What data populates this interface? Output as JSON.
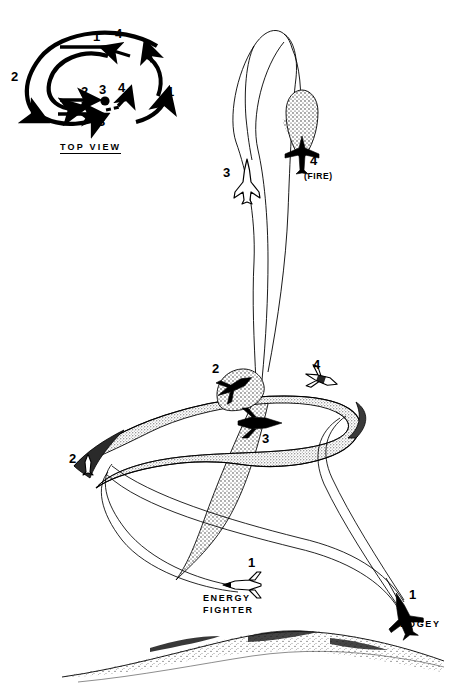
{
  "figure": {
    "title_visible": false,
    "background_color": "#ffffff",
    "ink_color": "#000000",
    "style": "black-and-white line art with stipple shading"
  },
  "top_view": {
    "label": "TOP VIEW",
    "description": "Overhead plan view of the two-circle fight showing four numbered positions for each aircraft",
    "merge_point_marker": "filled dot",
    "markers": [
      {
        "id": "tv-1-left",
        "text": "1",
        "x": 96,
        "y": 36,
        "meaning": "energy fighter position 1"
      },
      {
        "id": "tv-4-left",
        "text": "4",
        "x": 118,
        "y": 33,
        "meaning": "bogey position 4"
      },
      {
        "id": "tv-2-left",
        "text": "2",
        "x": 14,
        "y": 76,
        "meaning": "energy fighter position 2"
      },
      {
        "id": "tv-1-right",
        "text": "1",
        "x": 169,
        "y": 91,
        "meaning": "bogey position 1"
      },
      {
        "id": "tv-2-inner",
        "text": "2",
        "x": 84,
        "y": 90,
        "meaning": "bogey position 2"
      },
      {
        "id": "tv-3-inner",
        "text": "3",
        "x": 101,
        "y": 88,
        "meaning": "merge point 3"
      },
      {
        "id": "tv-4-inner",
        "text": "4",
        "x": 119,
        "y": 86,
        "meaning": "energy fighter position 4"
      },
      {
        "id": "tv-3-lower",
        "text": "3",
        "x": 100,
        "y": 119,
        "meaning": "bogey position 3"
      }
    ]
  },
  "side_view": {
    "description": "Perspective side view of a vertical rolling scissors: the dark bogey flies a wide banked ribbon trail while the outlined energy fighter flies thin-line trails, climbing to a firing position",
    "ground": {
      "type": "stippled ridge line",
      "present": true
    },
    "aircraft": [
      {
        "id": "energy-fighter-1",
        "number": "1",
        "caption": "ENERGY\nFIGHTER",
        "caption_line1": "ENERGY",
        "caption_line2": "FIGHTER",
        "fill": "outline",
        "x": 243,
        "y": 585,
        "num_x": 250,
        "num_y": 562,
        "cap_x": 205,
        "cap_y": 596
      },
      {
        "id": "bogey-1",
        "number": "1",
        "caption": "BOGEY",
        "fill": "solid",
        "x": 405,
        "y": 616,
        "num_x": 410,
        "num_y": 593,
        "cap_x": 400,
        "cap_y": 622
      },
      {
        "id": "energy-fighter-2",
        "number": "2",
        "caption": "",
        "fill": "outline",
        "x": 88,
        "y": 460,
        "num_x": 71,
        "num_y": 457
      },
      {
        "id": "bogey-2",
        "number": "2",
        "caption": "",
        "fill": "solid",
        "x": 234,
        "y": 387,
        "num_x": 214,
        "num_y": 368
      },
      {
        "id": "bogey-3",
        "number": "3",
        "caption": "",
        "fill": "solid",
        "x": 258,
        "y": 423,
        "num_x": 264,
        "num_y": 437
      },
      {
        "id": "energy-fighter-4",
        "number": "4",
        "caption": "",
        "fill": "outline",
        "x": 321,
        "y": 379,
        "num_x": 315,
        "num_y": 363
      },
      {
        "id": "energy-fighter-3",
        "number": "3",
        "caption": "",
        "fill": "outline",
        "x": 247,
        "y": 178,
        "num_x": 225,
        "num_y": 172
      },
      {
        "id": "bogey-4-fire",
        "number": "4",
        "caption": "(FIRE)",
        "fill": "solid",
        "x": 301,
        "y": 160,
        "num_x": 310,
        "num_y": 160,
        "cap_x": 304,
        "cap_y": 176
      }
    ]
  }
}
